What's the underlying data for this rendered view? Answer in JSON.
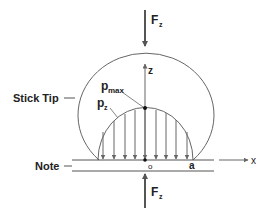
{
  "diagram": {
    "type": "contact-pressure-diagram",
    "labels": {
      "force_top": "F",
      "force_top_sub": "z",
      "force_bottom": "F",
      "force_bottom_sub": "z",
      "z_axis": "z",
      "x_axis": "x",
      "p_max": "p",
      "p_max_sub": "max",
      "p_z": "p",
      "p_z_sub": "z",
      "stick_tip": "Stick Tip",
      "note": "Note",
      "origin": "o",
      "contact_radius": "a"
    },
    "pressure_arrows_count": 9,
    "colors": {
      "line": "#555555",
      "text": "#222222",
      "background": "#ffffff"
    }
  }
}
